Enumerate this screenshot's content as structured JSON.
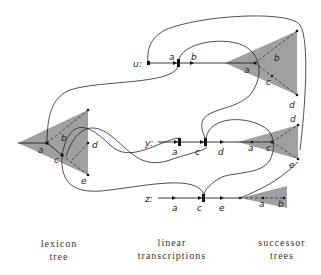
{
  "rows": [
    {
      "id": "u",
      "label": "u:",
      "nodes": [
        "a",
        "b"
      ]
    },
    {
      "id": "y",
      "label": "y:",
      "nodes": [
        "a",
        "c",
        "d"
      ]
    },
    {
      "id": "z",
      "label": "z:",
      "nodes": [
        "a",
        "c",
        "e"
      ]
    }
  ],
  "lexicon_tree": {
    "nodes": [
      "a",
      "b",
      "c",
      "d",
      "e"
    ]
  },
  "successor_trees": [
    {
      "row": "u",
      "nodes": [
        "a",
        "b",
        "c",
        "d"
      ]
    },
    {
      "row": "y",
      "nodes": [
        "a",
        "c",
        "d",
        "e"
      ]
    },
    {
      "row": "z",
      "nodes": [
        "a",
        "b"
      ]
    }
  ],
  "captions": {
    "lexicon": [
      "lexicon",
      "tree"
    ],
    "linear": [
      "linear",
      "transcriptions"
    ],
    "successor": [
      "successor",
      "trees"
    ]
  },
  "colors": {
    "triangle_fill": "#a0a0a0",
    "line": "#222222"
  }
}
